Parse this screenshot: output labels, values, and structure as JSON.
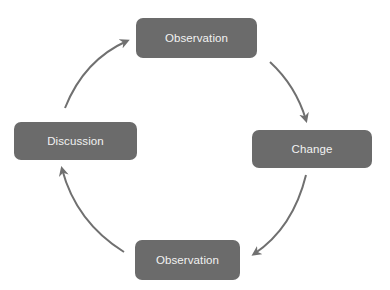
{
  "diagram": {
    "type": "cycle",
    "direction": "clockwise",
    "colors": {
      "node_fill": "#6b6b6b",
      "node_text": "#f2f2f2",
      "arrow": "#707070",
      "background": "#ffffff"
    },
    "nodes": [
      {
        "id": "top",
        "label": "Observation"
      },
      {
        "id": "right",
        "label": "Change"
      },
      {
        "id": "bottom",
        "label": "Observation"
      },
      {
        "id": "left",
        "label": "Discussion"
      }
    ],
    "edges": [
      {
        "from": "top",
        "to": "right"
      },
      {
        "from": "right",
        "to": "bottom"
      },
      {
        "from": "bottom",
        "to": "left"
      },
      {
        "from": "left",
        "to": "top"
      }
    ]
  }
}
